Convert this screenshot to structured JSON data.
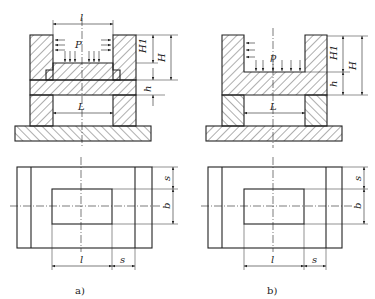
{
  "figure": {
    "colors": {
      "line": "#222222",
      "background": "#ffffff"
    },
    "panels": [
      {
        "caption": "a)",
        "section_labels": {
          "pressure": "P",
          "top_opening": "l",
          "upper_height": "H1",
          "total_height": "H",
          "plate_thickness": "h",
          "span": "L"
        },
        "plan_labels": {
          "length": "l",
          "side": "s",
          "side_v": "s",
          "width": "b"
        }
      },
      {
        "caption": "b)",
        "section_labels": {
          "pressure": "p",
          "upper_height": "H1",
          "total_height": "H",
          "plate_thickness": "h",
          "span": "L"
        },
        "plan_labels": {
          "length": "l",
          "side": "s",
          "side_v": "s",
          "width": "b"
        }
      }
    ]
  }
}
